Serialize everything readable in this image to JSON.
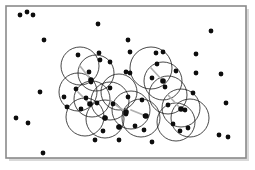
{
  "figure": {
    "width": 255,
    "height": 170,
    "background_color": "#ffffff",
    "frame": {
      "x": 6,
      "y": 6,
      "width": 240,
      "height": 152,
      "stroke_color": "#8a8a8a",
      "fill_color": "#ffffff",
      "stroke_width": 1.6,
      "shadow_color": "#d9d9d9"
    }
  },
  "chart_data": {
    "type": "scatter",
    "title": "",
    "xlabel": "",
    "ylabel": "",
    "grid": false,
    "legend": null,
    "xlim": [
      6,
      246
    ],
    "ylim": [
      6,
      158
    ],
    "point_color": "#0d0d0d",
    "point_radius": 2.4,
    "disk_stroke_color": "#1a1a1a",
    "disk_radius": 18,
    "radius_line_color": "#b0b0b0",
    "counts": {
      "points": 58,
      "disks": 16
    },
    "points": [
      [
        20,
        15
      ],
      [
        27,
        12
      ],
      [
        33,
        15
      ],
      [
        44,
        40
      ],
      [
        40,
        92
      ],
      [
        16,
        118
      ],
      [
        28,
        123
      ],
      [
        43,
        153
      ],
      [
        98,
        24
      ],
      [
        99,
        53
      ],
      [
        128,
        40
      ],
      [
        130,
        52
      ],
      [
        156,
        53
      ],
      [
        163,
        52
      ],
      [
        196,
        54
      ],
      [
        211,
        31
      ],
      [
        196,
        73
      ],
      [
        126,
        72
      ],
      [
        110,
        62
      ],
      [
        78,
        55
      ],
      [
        100,
        60
      ],
      [
        89,
        72
      ],
      [
        76,
        89
      ],
      [
        110,
        88
      ],
      [
        130,
        73
      ],
      [
        86,
        98
      ],
      [
        67,
        107
      ],
      [
        81,
        109
      ],
      [
        97,
        103
      ],
      [
        113,
        104
      ],
      [
        105,
        118
      ],
      [
        128,
        97
      ],
      [
        126,
        114
      ],
      [
        145,
        116
      ],
      [
        103,
        131
      ],
      [
        119,
        140
      ],
      [
        95,
        140
      ],
      [
        152,
        142
      ],
      [
        152,
        78
      ],
      [
        165,
        87
      ],
      [
        176,
        71
      ],
      [
        157,
        64
      ],
      [
        168,
        105
      ],
      [
        185,
        110
      ],
      [
        173,
        124
      ],
      [
        180,
        131
      ],
      [
        188,
        128
      ],
      [
        193,
        93
      ],
      [
        144,
        130
      ],
      [
        226,
        103
      ],
      [
        219,
        135
      ],
      [
        228,
        137
      ],
      [
        221,
        74
      ],
      [
        119,
        127
      ],
      [
        91,
        82
      ],
      [
        64,
        97
      ],
      [
        142,
        100
      ],
      [
        135,
        126
      ]
    ],
    "disks": [
      {
        "cx": 80,
        "cy": 66,
        "r": 19,
        "radius_to": [
          91,
          80
        ]
      },
      {
        "cx": 96,
        "cy": 73,
        "r": 18,
        "radius_to": [
          96,
          73
        ]
      },
      {
        "cx": 78,
        "cy": 92,
        "r": 19,
        "radius_to": [
          90,
          104
        ]
      },
      {
        "cx": 92,
        "cy": 99,
        "r": 18,
        "radius_to": [
          92,
          99
        ]
      },
      {
        "cx": 85,
        "cy": 117,
        "r": 19,
        "radius_to": [
          85,
          117
        ]
      },
      {
        "cx": 105,
        "cy": 119,
        "r": 19,
        "radius_to": [
          105,
          119
        ]
      },
      {
        "cx": 110,
        "cy": 101,
        "r": 19,
        "radius_to": [
          126,
          112
        ]
      },
      {
        "cx": 131,
        "cy": 110,
        "r": 19,
        "radius_to": [
          146,
          116
        ]
      },
      {
        "cx": 151,
        "cy": 68,
        "r": 21,
        "radius_to": [
          163,
          81
        ]
      },
      {
        "cx": 163,
        "cy": 81,
        "r": 19,
        "radius_to": [
          163,
          81
        ]
      },
      {
        "cx": 168,
        "cy": 95,
        "r": 19,
        "radius_to": [
          181,
          109
        ]
      },
      {
        "cx": 181,
        "cy": 108,
        "r": 19,
        "radius_to": [
          181,
          108
        ]
      },
      {
        "cx": 190,
        "cy": 118,
        "r": 19,
        "radius_to": [
          190,
          118
        ]
      },
      {
        "cx": 176,
        "cy": 122,
        "r": 19,
        "radius_to": [
          176,
          122
        ]
      },
      {
        "cx": 119,
        "cy": 92,
        "r": 18,
        "radius_to": [
          119,
          92
        ]
      },
      {
        "cx": 141,
        "cy": 118,
        "r": 19,
        "radius_to": [
          141,
          118
        ]
      }
    ],
    "disk_centers_marked": [
      [
        91,
        80
      ],
      [
        90,
        104
      ],
      [
        126,
        112
      ],
      [
        146,
        116
      ],
      [
        163,
        81
      ],
      [
        181,
        109
      ],
      [
        119,
        127
      ],
      [
        105,
        118
      ]
    ]
  }
}
